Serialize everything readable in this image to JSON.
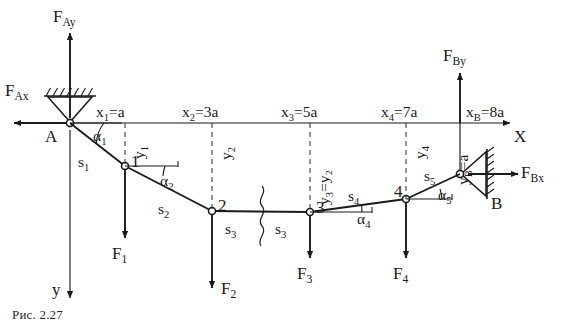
{
  "figure": {
    "caption": "Рис. 2.27",
    "axes": {
      "x_axis_label": "X",
      "y_axis_label": "y"
    },
    "supports": [
      {
        "id": "A",
        "label": "A",
        "type": "pin-support-hatched-top",
        "x": 70,
        "y": 123
      },
      {
        "id": "B",
        "label": "B",
        "type": "pin-support-hatched-right",
        "x": 460,
        "y": 174
      }
    ],
    "reactions": [
      {
        "name": "F_Ax",
        "label": "F",
        "sub": "Ax",
        "direction": "left",
        "at": "A"
      },
      {
        "name": "F_Ay",
        "label": "F",
        "sub": "Ay",
        "direction": "up",
        "at": "A"
      },
      {
        "name": "F_Bx",
        "label": "F",
        "sub": "Bx",
        "direction": "right",
        "at": "B"
      },
      {
        "name": "F_By",
        "label": "F",
        "sub": "By",
        "direction": "up",
        "at": "B"
      }
    ],
    "nodes": [
      {
        "id": "1",
        "label": "1",
        "x": 125,
        "y": 166
      },
      {
        "id": "2",
        "label": "2",
        "x": 212,
        "y": 211
      },
      {
        "id": "3",
        "label": "3",
        "x": 310,
        "y": 212
      },
      {
        "id": "4",
        "label": "4",
        "x": 406,
        "y": 199
      }
    ],
    "loads": [
      {
        "name": "F_1",
        "label": "F",
        "sub": "1",
        "node": "1",
        "direction": "down"
      },
      {
        "name": "F_2",
        "label": "F",
        "sub": "2",
        "node": "2",
        "direction": "down"
      },
      {
        "name": "F_3",
        "label": "F",
        "sub": "3",
        "node": "3",
        "direction": "down"
      },
      {
        "name": "F_4",
        "label": "F",
        "sub": "4",
        "node": "4",
        "direction": "down"
      }
    ],
    "segments": [
      {
        "name": "s_1",
        "label": "s",
        "sub": "1",
        "from": "A",
        "to": "1"
      },
      {
        "name": "s_2",
        "label": "s",
        "sub": "2",
        "from": "1",
        "to": "2"
      },
      {
        "name": "s_3_left",
        "label": "s",
        "sub": "3",
        "from": "2",
        "to": "break"
      },
      {
        "name": "s_3_right",
        "label": "s",
        "sub": "3",
        "from": "break",
        "to": "3"
      },
      {
        "name": "s_4",
        "label": "s",
        "sub": "4",
        "from": "3",
        "to": "4"
      },
      {
        "name": "s_5",
        "label": "s",
        "sub": "5",
        "from": "4",
        "to": "B"
      }
    ],
    "angles": [
      {
        "name": "alpha_1",
        "label": "α",
        "sub": "1",
        "at": "A"
      },
      {
        "name": "alpha_2",
        "label": "α",
        "sub": "2",
        "at": "1"
      },
      {
        "name": "alpha_4",
        "label": "α",
        "sub": "4",
        "at": "3"
      },
      {
        "name": "alpha_5",
        "label": "α",
        "sub": "5",
        "at": "4"
      }
    ],
    "x_coordinates": [
      {
        "name": "x_1",
        "text": "x",
        "sub": "1",
        "value": "=a"
      },
      {
        "name": "x_2",
        "text": "x",
        "sub": "2",
        "value": "=3a"
      },
      {
        "name": "x_3",
        "text": "x",
        "sub": "3",
        "value": "=5a"
      },
      {
        "name": "x_4",
        "text": "x",
        "sub": "4",
        "value": "=7a"
      },
      {
        "name": "x_B",
        "text": "x",
        "sub": "B",
        "value": "=8a"
      }
    ],
    "y_coordinates": [
      {
        "name": "y_1",
        "text": "y",
        "sub": "1",
        "value": ""
      },
      {
        "name": "y_2",
        "text": "y",
        "sub": "2",
        "value": ""
      },
      {
        "name": "y_3",
        "text": "y",
        "sub": "3",
        "value": "=y₂"
      },
      {
        "name": "y_4",
        "text": "y",
        "sub": "4",
        "value": ""
      },
      {
        "name": "y_B",
        "text": "y",
        "sub": "B",
        "value": "=a"
      }
    ],
    "break_symbol": {
      "name": "wavy-break",
      "x": 262,
      "y": 212
    }
  },
  "style": {
    "line_color": "#1a1a1a",
    "dash_color": "#333333",
    "text_color": "#1a1a1a",
    "background": "#ffffff"
  }
}
